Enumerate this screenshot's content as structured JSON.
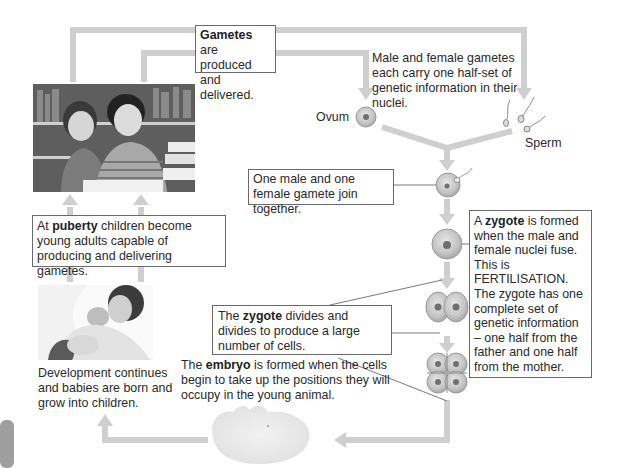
{
  "diagram": {
    "colors": {
      "arrow": "#cfcfcf",
      "box_border": "#6a6a6a",
      "cell_fill": "#c9c9c9",
      "cell_edge": "#9a9a9a",
      "nucleus": "#707070",
      "text": "#2a2a2a"
    },
    "boxes": {
      "gametes": {
        "bold": "Gametes",
        "rest": " are produced and delivered."
      },
      "join": {
        "text": "One male and one female gamete join together."
      },
      "zygote": {
        "pre": "A ",
        "bold": "zygote",
        "rest": " is formed when the male and female nuclei fuse. This is FERTILISATION. The zygote has one complete set of genetic information – one half from the father and one half from the mother."
      },
      "puberty": {
        "pre": "At ",
        "bold": "puberty",
        "rest": " children become young adults capable of producing and delivering gametes."
      },
      "divides": {
        "pre": "The ",
        "bold": "zygote",
        "rest": " divides and divides to produce a large number of cells."
      }
    },
    "texts": {
      "gametes_info": "Male and female gametes each carry one half-set of genetic information in their nuclei.",
      "embryo": {
        "pre": "The ",
        "bold": "embryo",
        "rest": " is formed when the cells begin to take up the positions they will occupy in the young animal."
      },
      "development": "Development continues and babies are born and grow into children."
    },
    "labels": {
      "ovum": "Ovum",
      "sperm": "Sperm"
    },
    "images": {
      "teenagers": "photo-teenagers",
      "baby": "photo-child-holding-baby",
      "embryo": "embryo-illustration"
    },
    "stages": [
      "gametes",
      "fertilised-egg",
      "zygote",
      "two-cell",
      "four-cell",
      "embryo",
      "baby",
      "child",
      "adult"
    ]
  }
}
